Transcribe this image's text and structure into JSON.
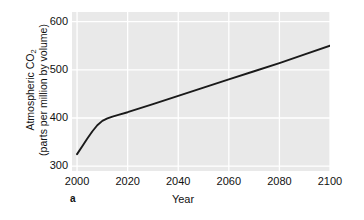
{
  "figure": {
    "panel_label": "a",
    "background_color": "#ffffff",
    "plot_background_color": "#e9e9e9",
    "gridline_color": "#ffffff",
    "line_color": "#1a1a1a"
  },
  "chart_data": {
    "type": "line",
    "title": "",
    "xlabel": "Year",
    "ylabel_line1": "Atmospheric CO₂",
    "ylabel_line2": "(parts per million by volume)",
    "ylabel": "Atmospheric CO2 (parts per million by volume)",
    "xlim": [
      1998,
      2100
    ],
    "ylim": [
      290,
      620
    ],
    "xticks": [
      2000,
      2020,
      2040,
      2060,
      2080,
      2100
    ],
    "xticklabels": [
      "2000",
      "2020",
      "2040",
      "2060",
      "2080",
      "2100"
    ],
    "yticks": [
      300,
      400,
      500,
      600
    ],
    "yticklabels": [
      "300",
      "400",
      "500",
      "600"
    ],
    "grid": true,
    "legend": "none",
    "series": [
      {
        "name": "Atmospheric CO2 projection",
        "x": [
          2000,
          2002,
          2004,
          2006,
          2008,
          2010,
          2012,
          2014,
          2016,
          2020,
          2030,
          2040,
          2050,
          2060,
          2070,
          2080,
          2090,
          2100
        ],
        "values": [
          325,
          341,
          357,
          372,
          385,
          394,
          399,
          403,
          406,
          412,
          429,
          446,
          463,
          480,
          497,
          514,
          532,
          550
        ]
      }
    ]
  }
}
